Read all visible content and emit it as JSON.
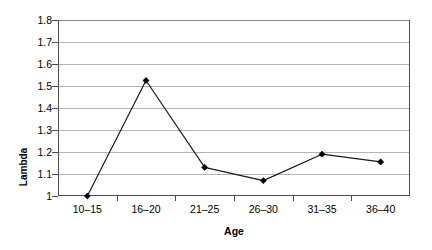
{
  "chart_data": {
    "type": "line",
    "title": "",
    "xlabel": "Age",
    "ylabel": "Lambda",
    "categories": [
      "10–15",
      "16–20",
      "21–25",
      "26–30",
      "31–35",
      "36–40"
    ],
    "series": [
      {
        "name": "Lambda",
        "values": [
          1.0,
          1.525,
          1.13,
          1.07,
          1.19,
          1.155
        ]
      }
    ],
    "ylim": [
      1.0,
      1.8
    ],
    "ytick_labels": [
      "1.8",
      "1.7",
      "1.6",
      "1.5",
      "1.4",
      "1.3",
      "1.2",
      "1.1",
      "1"
    ],
    "ytick_values": [
      1.8,
      1.7,
      1.6,
      1.5,
      1.4,
      1.3,
      1.2,
      1.1,
      1.0
    ],
    "grid": true,
    "grid_axis": "y",
    "legend": false,
    "legend_position": "none",
    "marker": "diamond",
    "line_color": "#1a1a1a",
    "marker_color": "#000000",
    "grid_color": "#b3b3b3",
    "axis_color": "#4d4d4d",
    "background_color": "#ffffff"
  }
}
